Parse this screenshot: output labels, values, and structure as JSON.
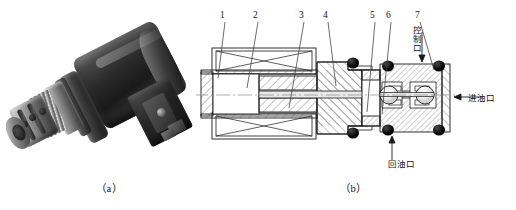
{
  "figure": {
    "subfigures": [
      {
        "id": "a",
        "caption": "（a）",
        "type": "photograph",
        "subject": "solenoid cartridge valve"
      },
      {
        "id": "b",
        "caption": "（b）",
        "type": "cross-section-diagram",
        "subject": "solenoid cartridge valve sectional view"
      }
    ]
  },
  "photo": {
    "alt": "Photograph of a solenoid-operated cartridge valve with dark cylindrical coil, electrical connector box and chrome threaded cartridge body"
  },
  "diagram": {
    "callouts": [
      {
        "number": "1",
        "x": 26,
        "y": 14
      },
      {
        "number": "2",
        "x": 59,
        "y": 14
      },
      {
        "number": "3",
        "x": 105,
        "y": 14
      },
      {
        "number": "4",
        "x": 129,
        "y": 14
      },
      {
        "number": "5",
        "x": 176,
        "y": 14
      },
      {
        "number": "6",
        "x": 192,
        "y": 14
      },
      {
        "number": "7",
        "x": 221,
        "y": 14
      }
    ],
    "port_labels": [
      {
        "name": "control-port",
        "text": "控制口",
        "orientation": "vertical",
        "arrow": "down"
      },
      {
        "name": "oil-inlet-port",
        "text": "进油口",
        "orientation": "horizontal",
        "arrow": "left"
      },
      {
        "name": "oil-return-port",
        "text": "回油口",
        "orientation": "horizontal",
        "arrow": "up"
      }
    ]
  },
  "colors": {
    "line": "#1a1a1a",
    "hatch": "#6f6f6f",
    "seal": "#101010",
    "background": "#ffffff"
  }
}
